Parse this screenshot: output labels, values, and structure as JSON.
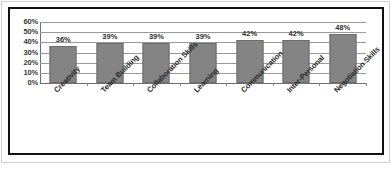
{
  "chart_data": {
    "type": "bar",
    "title": "",
    "subtitle": "",
    "xlabel": "",
    "ylabel": "",
    "categories": [
      "Creativity",
      "Team Building",
      "Collaboration Skills",
      "Learning",
      "Communication",
      "Inter-Personal",
      "Negotiation Skills"
    ],
    "values": [
      36,
      39,
      39,
      39,
      42,
      42,
      48
    ],
    "value_labels": [
      "36%",
      "39%",
      "39%",
      "39%",
      "42%",
      "42%",
      "48%"
    ],
    "ylim": [
      0,
      60
    ],
    "ytick_values": [
      0,
      10,
      20,
      30,
      40,
      50,
      60
    ],
    "ytick_labels": [
      "0%",
      "10%",
      "20%",
      "30%",
      "40%",
      "50%",
      "60%"
    ],
    "grid": true,
    "grid_axis": "y",
    "legend": false,
    "legend_position": "none",
    "bar_color": "#848484",
    "bar_border_color": "#6d6d6d",
    "gridline_color": "#9a9a9a",
    "axis_color": "#6e6e6e",
    "frame_color": "#111111",
    "background_color": "#ffffff",
    "label_color": "#2f2f2f"
  }
}
